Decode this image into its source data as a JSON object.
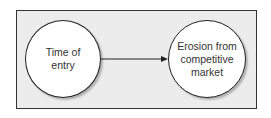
{
  "diagram": {
    "nodes": [
      {
        "id": "time-of-entry",
        "label": "Time of\nentry"
      },
      {
        "id": "erosion",
        "label": "Erosion from\ncompetitive\nmarket"
      }
    ],
    "edges": [
      {
        "from": "time-of-entry",
        "to": "erosion"
      }
    ],
    "colors": {
      "frame_bg": "#ececec",
      "node_bg": "#ffffff",
      "stroke": "#222222",
      "text": "#333333"
    }
  }
}
